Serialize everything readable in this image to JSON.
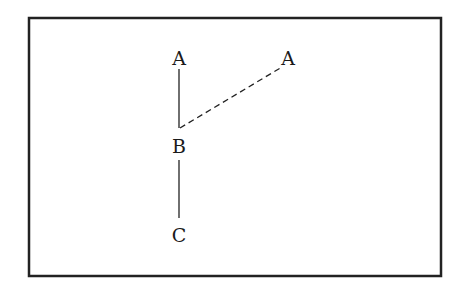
{
  "diagram": {
    "frame": {
      "x": 29,
      "y": 18,
      "width": 412,
      "height": 258,
      "stroke": "#222222"
    },
    "nodes": [
      {
        "id": "A1",
        "label": "A",
        "x": 179,
        "y": 65
      },
      {
        "id": "A2",
        "label": "A",
        "x": 288,
        "y": 65
      },
      {
        "id": "B",
        "label": "B",
        "x": 179,
        "y": 153
      },
      {
        "id": "C",
        "label": "C",
        "x": 179,
        "y": 242
      }
    ],
    "edges": [
      {
        "from": "A1",
        "to": "B",
        "style": "solid",
        "x1": 179,
        "y1": 69,
        "x2": 179,
        "y2": 128
      },
      {
        "from": "B",
        "to": "C",
        "style": "solid",
        "x1": 179,
        "y1": 160,
        "x2": 179,
        "y2": 218
      },
      {
        "from": "B",
        "to": "A2",
        "style": "dashed",
        "x1": 180,
        "y1": 128,
        "x2": 282,
        "y2": 67
      }
    ]
  }
}
